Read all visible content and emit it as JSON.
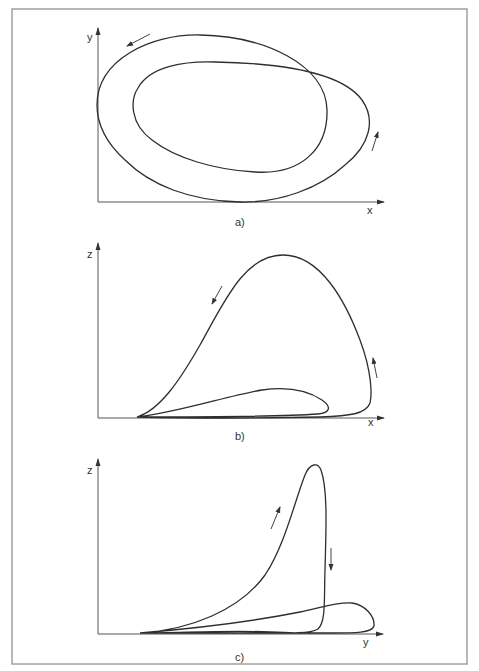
{
  "figure": {
    "colors": {
      "background": "#ffffff",
      "frame": "#9a9a9a",
      "axis": "#555555",
      "curve": "#2e2e2e"
    },
    "panels": [
      {
        "id": "a",
        "label": "a)",
        "x_axis_label": "x",
        "y_axis_label": "y",
        "description": "Projection of a two-loop limit cycle onto the x–y plane; two overlapping closed orbits, counter-clockwise flow"
      },
      {
        "id": "b",
        "label": "b)",
        "x_axis_label": "x",
        "y_axis_label": "z",
        "description": "Projection onto x–z plane; one large spike loop and one small low loop near the x axis"
      },
      {
        "id": "c",
        "label": "c)",
        "x_axis_label": "y",
        "y_axis_label": "z",
        "description": "Projection onto y–z plane; tall narrow spike loop and a small low loop near the y axis"
      }
    ]
  }
}
